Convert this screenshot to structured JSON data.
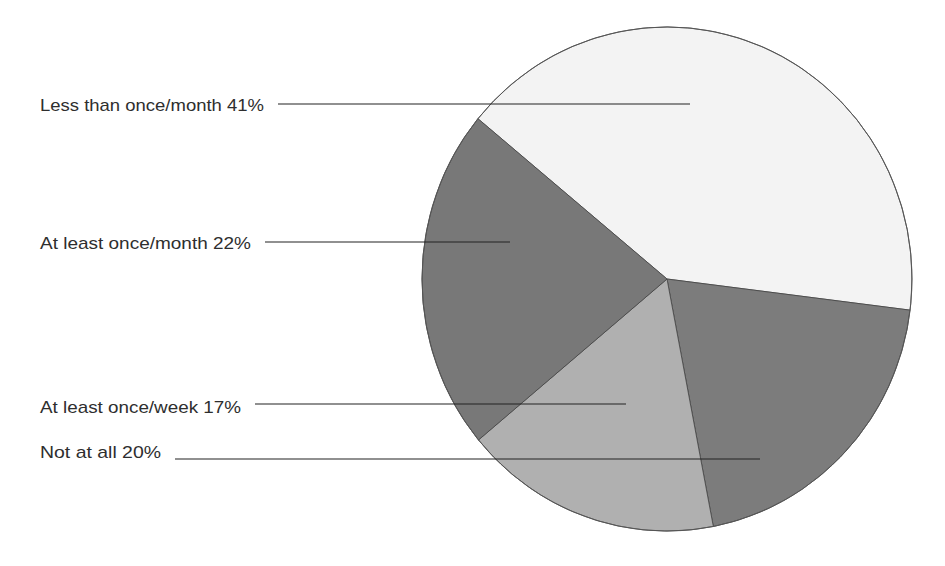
{
  "chart_data": {
    "type": "pie",
    "title": "",
    "unit": "%",
    "slices": [
      {
        "label": "Less than once/month",
        "value": 41,
        "display": "Less than once/month  41%",
        "color": "#f3f3f3"
      },
      {
        "label": "Not at all",
        "value": 20,
        "display": "Not at all  20%",
        "color": "#7c7c7c"
      },
      {
        "label": "At least once/week",
        "value": 17,
        "display": "At least once/week  17%",
        "color": "#b0b0b0"
      },
      {
        "label": "At least once/month",
        "value": 22,
        "display": "At least once/month  22%",
        "color": "#787878"
      }
    ],
    "legend": "leader-line labels on left"
  }
}
